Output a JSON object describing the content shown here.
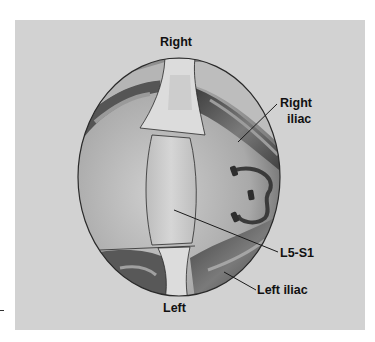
{
  "figure": {
    "type": "anatomical-illustration",
    "labels": {
      "top": "Right",
      "bottom": "Left",
      "right_iliac_line1": "Right",
      "right_iliac_line2": "iliac",
      "disc": "L5-S1",
      "left_iliac": "Left iliac"
    },
    "colors": {
      "panel_background": "#d2d2d2",
      "outline": "#2a2a2a",
      "vessel_dark": "#4a4a4a",
      "tissue_light": "#c8c8c8",
      "ligament": "#dedede"
    }
  }
}
